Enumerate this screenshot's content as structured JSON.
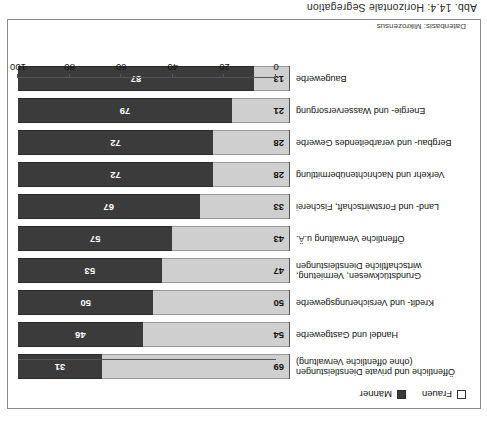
{
  "caption": "Abb. 14.4:  Horizontale Segregation",
  "source_note": "Datenbasis: Mikrozensus",
  "legend": {
    "frauen_label": "Frauen",
    "maenner_label": "Männer",
    "frauen_color": "#cfcfcf",
    "maenner_color": "#3b3b3b"
  },
  "axis": {
    "ticks": [
      "0",
      "20",
      "40",
      "60",
      "80",
      "100"
    ],
    "min": 0,
    "max": 100
  },
  "chart_data": {
    "type": "bar",
    "title": "Abb. 14.4:  Horizontale Segregation",
    "subtitle": "Datenbasis: Mikrozensus",
    "orientation": "horizontal",
    "stacked": true,
    "xlabel": "",
    "ylabel": "",
    "xlim": [
      0,
      100
    ],
    "grid": false,
    "legend_position": "bottom-left",
    "categories": [
      "Baugewerbe",
      "Energie- und Wasserversorgung",
      "Bergbau- und verarbeitendes Gewerbe",
      "Verkehr und Nachrichtenübermittlung",
      "Land- und Forstwirtschaft, Fischerei",
      "Öffentliche Verwaltung u.Ä.",
      "Grundstückwesen, Vermietung,\nwirtschaftliche Dienstleistungen",
      "Kredit- und Versicherungsgewerbe",
      "Handel und Gastgewerbe",
      "Öffentliche und private Dienstleistungen\n(ohne öffentliche Verwaltung)"
    ],
    "series": [
      {
        "name": "Frauen",
        "color": "#cfcfcf",
        "values": [
          13,
          21,
          28,
          28,
          33,
          43,
          47,
          50,
          54,
          69
        ]
      },
      {
        "name": "Männer",
        "color": "#3b3b3b",
        "values": [
          87,
          79,
          72,
          72,
          67,
          57,
          53,
          50,
          46,
          31
        ]
      }
    ]
  }
}
